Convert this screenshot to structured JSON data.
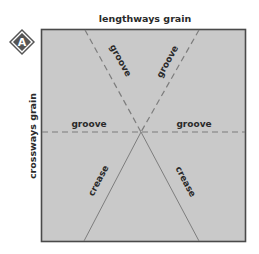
{
  "badge": {
    "label": "A",
    "fill": "#555555",
    "border": "#ffffff"
  },
  "axes": {
    "top_label": "lengthways grain",
    "side_label": "crossways grain"
  },
  "sheet": {
    "fill": "#c8c8c8",
    "border": "#4a4a4a"
  },
  "lines": {
    "groove_style": "dashed",
    "crease_style": "solid",
    "color": "#7a7a7a"
  },
  "labels": {
    "groove_upper_left": "groove",
    "groove_upper_right": "groove",
    "groove_left": "groove",
    "groove_right": "groove",
    "crease_lower_left": "crease",
    "crease_lower_right": "crease"
  }
}
